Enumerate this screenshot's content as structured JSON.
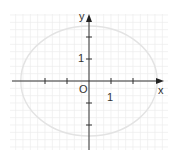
{
  "figure": {
    "type": "coordinate-plane-ellipse",
    "labels": {
      "x_axis": "x",
      "y_axis": "y",
      "origin": "O",
      "x_unit": "1",
      "y_unit": "1"
    },
    "colors": {
      "axis": "#333333",
      "grid": "#ececec",
      "ellipse": "#e3e3e3",
      "background": "#ffffff"
    },
    "geometry": {
      "origin_px": [
        89,
        81
      ],
      "unit_px": 22,
      "ellipse_semi_axis_x_units": 3.1,
      "ellipse_semi_axis_y_units": 2.5,
      "x_ticks": [
        -2,
        -1,
        1,
        2
      ],
      "y_ticks": [
        2,
        1,
        -1,
        -2
      ]
    }
  },
  "chart_data": {
    "type": "scatter",
    "title": "",
    "xlabel": "x",
    "ylabel": "y",
    "xlim": [
      -3.5,
      3.4
    ],
    "ylim": [
      -3.1,
      3.0
    ],
    "grid": true,
    "annotations": [
      "O",
      "1",
      "1"
    ],
    "series": [
      {
        "name": "ellipse",
        "shape": "ellipse",
        "center": [
          0,
          0
        ],
        "semi_axis_x": 3.1,
        "semi_axis_y": 2.5
      }
    ]
  }
}
